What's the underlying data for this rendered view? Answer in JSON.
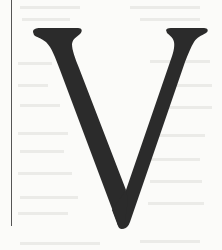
{
  "image": {
    "description": "Scanned page showing a large decorative serif drop-cap letter",
    "letter": "V",
    "colors": {
      "background": "#fbfbf9",
      "ink": "#2b2b2b",
      "margin_rule": "#555555",
      "bleed_through": "#e4e4e1"
    }
  }
}
